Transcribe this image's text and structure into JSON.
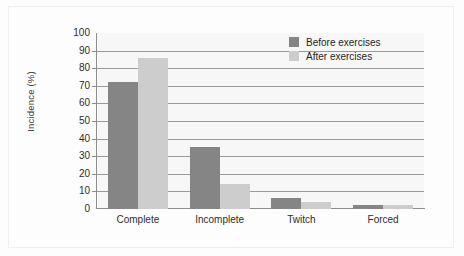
{
  "chart_data": {
    "type": "bar",
    "title": "",
    "xlabel": "",
    "ylabel": "Incidence (%)",
    "categories": [
      "Complete",
      "Incomplete",
      "Twitch",
      "Forced"
    ],
    "series": [
      {
        "name": "Before exercises",
        "color": "#858585",
        "values": [
          72,
          35,
          6,
          2
        ]
      },
      {
        "name": "After exercises",
        "color": "#cdcdcd",
        "values": [
          86,
          14,
          4,
          2
        ]
      }
    ],
    "ylim": [
      0,
      100
    ],
    "yticks": [
      0,
      10,
      20,
      30,
      40,
      50,
      60,
      70,
      80,
      90,
      100
    ],
    "ytick_labels": [
      "0",
      "10",
      "20",
      "30",
      "40",
      "50",
      "60",
      "70",
      "80",
      "90",
      "100"
    ],
    "grid": true,
    "grid_axis": "y",
    "legend_position": "top-right",
    "plot_background": "#f7f7f7"
  },
  "legend": {
    "entries": [
      {
        "label": "Before exercises",
        "swatch": "#858585"
      },
      {
        "label": "After exercises",
        "swatch": "#cdcdcd"
      }
    ]
  }
}
